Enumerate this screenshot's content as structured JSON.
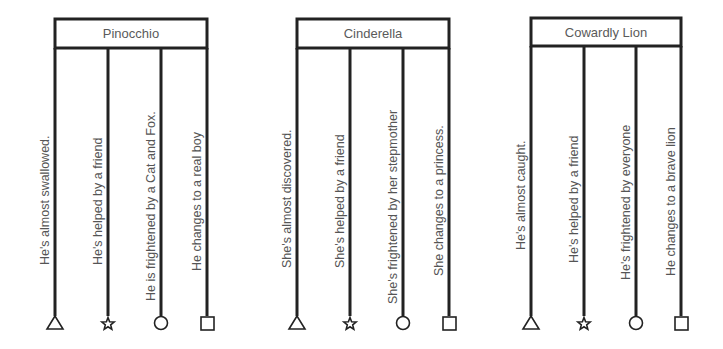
{
  "colors": {
    "line": "#222222",
    "text": "#555555",
    "background": "#ffffff"
  },
  "diagrams": [
    {
      "title": "Pinocchio",
      "box": {
        "left": 55,
        "right": 207,
        "top": 19,
        "bottom": 48
      },
      "branches": [
        {
          "x": 55,
          "label": "He's almost swallowed.",
          "end_shape": "triangle",
          "label_bottom": 265
        },
        {
          "x": 108,
          "label": "He's helped by a friend",
          "end_shape": "star",
          "label_bottom": 265
        },
        {
          "x": 161,
          "label": "He is frightened by a Cat and Fox.",
          "end_shape": "circle",
          "label_bottom": 301
        },
        {
          "x": 207,
          "label": "He changes to a real boy",
          "end_shape": "square",
          "label_bottom": 271
        }
      ]
    },
    {
      "title": "Cinderella",
      "box": {
        "left": 297,
        "right": 449,
        "top": 19,
        "bottom": 48
      },
      "branches": [
        {
          "x": 297,
          "label": "She's almost discovered.",
          "end_shape": "triangle",
          "label_bottom": 268
        },
        {
          "x": 350,
          "label": "She's helped by a friend",
          "end_shape": "star",
          "label_bottom": 268
        },
        {
          "x": 403,
          "label": "She's frightened by her stepmother",
          "end_shape": "circle",
          "label_bottom": 304
        },
        {
          "x": 449,
          "label": "She changes to a princess.",
          "end_shape": "square",
          "label_bottom": 276
        }
      ]
    },
    {
      "title": "Cowardly Lion",
      "box": {
        "left": 531,
        "right": 681,
        "top": 18,
        "bottom": 46
      },
      "branches": [
        {
          "x": 531,
          "label": "He's almost caught.",
          "end_shape": "triangle",
          "label_bottom": 250
        },
        {
          "x": 584,
          "label": "He's helped by a friend",
          "end_shape": "star",
          "label_bottom": 263
        },
        {
          "x": 636,
          "label": "He's frightened by everyone",
          "end_shape": "circle",
          "label_bottom": 280
        },
        {
          "x": 681,
          "label": "He changes to a brave lion",
          "end_shape": "square",
          "label_bottom": 276
        }
      ]
    }
  ],
  "layout": {
    "line_bottom": 316,
    "shape_center_y": 323
  }
}
